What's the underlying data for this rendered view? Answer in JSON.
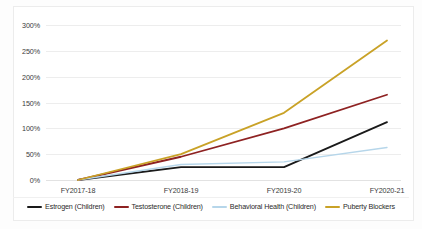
{
  "chart_data": {
    "type": "line",
    "title": "",
    "xlabel": "",
    "ylabel": "",
    "categories": [
      "FY2017-18",
      "FY2018-19",
      "FY2019-20",
      "FY2020-21"
    ],
    "ylim": [
      0,
      300
    ],
    "yticks": [
      0,
      50,
      100,
      150,
      200,
      250,
      300
    ],
    "ytick_labels": [
      "0%",
      "50%",
      "100%",
      "150%",
      "200%",
      "250%",
      "300%"
    ],
    "grid": true,
    "legend_position": "bottom",
    "value_suffix": "%",
    "series": [
      {
        "name": "Estrogen (Children)",
        "color": "#1a1a1a",
        "values": [
          0,
          25,
          25,
          112
        ]
      },
      {
        "name": "Testosterone (Children)",
        "color": "#8e2222",
        "values": [
          0,
          45,
          100,
          165
        ]
      },
      {
        "name": "Behavioral Health (Children)",
        "color": "#b6d6ea",
        "values": [
          0,
          30,
          35,
          63
        ]
      },
      {
        "name": "Puberty Blockers",
        "color": "#c9a227",
        "values": [
          0,
          50,
          130,
          270
        ]
      }
    ]
  },
  "legend": {
    "items": [
      {
        "label": "Estrogen (Children)",
        "color": "#1a1a1a"
      },
      {
        "label": "Testosterone (Children)",
        "color": "#8e2222"
      },
      {
        "label": "Behavioral Health (Children)",
        "color": "#b6d6ea"
      },
      {
        "label": "Puberty Blockers",
        "color": "#c9a227"
      }
    ]
  }
}
